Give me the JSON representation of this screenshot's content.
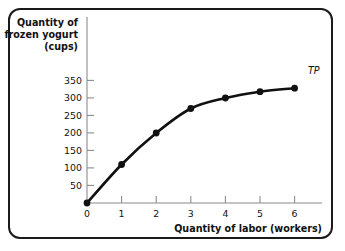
{
  "chart_data": {
    "type": "line",
    "title": "",
    "xlabel": "Quantity of labor (workers)",
    "ylabel": "Quantity of frozen yogurt (cups)",
    "ylabel_lines": [
      "Quantity of",
      "frozen yogurt",
      "(cups)"
    ],
    "x": [
      0,
      1,
      2,
      3,
      4,
      5,
      6
    ],
    "values": [
      0,
      110,
      200,
      270,
      300,
      318,
      328
    ],
    "series": [
      {
        "name": "TP",
        "values": [
          0,
          110,
          200,
          270,
          300,
          318,
          328
        ]
      }
    ],
    "xticks": [
      "0",
      "1",
      "2",
      "3",
      "4",
      "5",
      "6"
    ],
    "yticks": [
      "50",
      "100",
      "150",
      "200",
      "250",
      "300",
      "350"
    ],
    "ytick_values": [
      50,
      100,
      150,
      200,
      250,
      300,
      350
    ],
    "y_origin_label": "0",
    "xlim": [
      0,
      6.4
    ],
    "ylim": [
      0,
      400
    ],
    "grid": false,
    "legend": "none",
    "annotations": [
      {
        "text": "TP",
        "x": 6,
        "y": 328,
        "style": "italic"
      }
    ],
    "colors": {
      "curve": "#111111",
      "marker": "#111111",
      "axis": "#8c8c8c",
      "text": "#111111",
      "frame": "#1a1a1a",
      "background": "#ffffff"
    }
  }
}
